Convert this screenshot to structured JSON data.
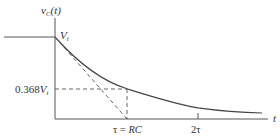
{
  "diagram": {
    "y_axis_label": {
      "var": "v",
      "sub": "C",
      "arg": "(t)"
    },
    "x_axis_label": "t",
    "initial_value_label": {
      "var": "V",
      "sub": "i"
    },
    "level_label": {
      "prefix": "0.368",
      "var": "V",
      "sub": "i"
    },
    "tick_labels": [
      {
        "id": "tau",
        "text_tau": "τ = ",
        "text_rc": "RC"
      },
      {
        "id": "two_tau",
        "text": "2τ"
      }
    ],
    "colors": {
      "line": "#555555",
      "curve": "#444444",
      "background": "#ffffff"
    }
  }
}
